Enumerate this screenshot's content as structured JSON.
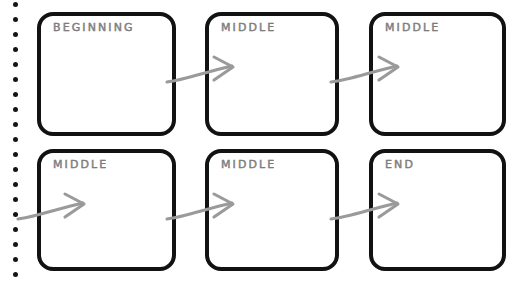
{
  "document": {
    "type": "storyboard-worksheet",
    "medium": "spiral-bound notebook page",
    "title_text_style": "hand-lettered outline capitals",
    "background_color": "#ffffff",
    "frame_border_color": "#121212",
    "label_color": "#8f8f8f",
    "arrow_color": "#9a9a9a",
    "binding_dot_color": "#151515"
  },
  "binding": {
    "name": "spiral-binding",
    "dot_count": 19,
    "dot_diameter_px": 5,
    "first_dot_y": 2,
    "dot_spacing_px": 15,
    "dot_center_x": 15
  },
  "frames": [
    {
      "id": "frame-1",
      "label": "BEGINNING",
      "row": 1,
      "column": 1,
      "x": 37,
      "y": 12,
      "width": 139,
      "height": 124,
      "content": ""
    },
    {
      "id": "frame-2",
      "label": "MIDDLE",
      "row": 1,
      "column": 2,
      "x": 205,
      "y": 12,
      "width": 134,
      "height": 124,
      "content": ""
    },
    {
      "id": "frame-3",
      "label": "MIDDLE",
      "row": 1,
      "column": 3,
      "x": 369,
      "y": 12,
      "width": 137,
      "height": 124,
      "content": ""
    },
    {
      "id": "frame-4",
      "label": "MIDDLE",
      "row": 2,
      "column": 1,
      "x": 37,
      "y": 149,
      "width": 139,
      "height": 122,
      "content": ""
    },
    {
      "id": "frame-5",
      "label": "MIDDLE",
      "row": 2,
      "column": 2,
      "x": 205,
      "y": 149,
      "width": 134,
      "height": 122,
      "content": ""
    },
    {
      "id": "frame-6",
      "label": "END",
      "row": 2,
      "column": 3,
      "x": 369,
      "y": 149,
      "width": 137,
      "height": 122,
      "content": ""
    }
  ],
  "arrows": [
    {
      "id": "arrow-1",
      "name": "arrow-frame1-to-frame2",
      "from": "frame-1",
      "to": "frame-2",
      "path": "M 167 82 C 185 80 205 72 232 66",
      "head": "M 214 57 L 233 67 L 214 80"
    },
    {
      "id": "arrow-2",
      "name": "arrow-frame2-to-frame3",
      "from": "frame-2",
      "to": "frame-3",
      "path": "M 331 82 C 350 80 370 72 397 66",
      "head": "M 379 57 L 398 67 L 379 80"
    },
    {
      "id": "arrow-3",
      "name": "arrow-margin-to-frame4",
      "from": "page-margin",
      "to": "frame-4",
      "path": "M 18 219 C 36 217 56 209 83 203",
      "head": "M 65 194 L 84 204 L 65 217"
    },
    {
      "id": "arrow-4",
      "name": "arrow-frame4-to-frame5",
      "from": "frame-4",
      "to": "frame-5",
      "path": "M 167 219 C 185 217 205 209 232 203",
      "head": "M 214 194 L 233 204 L 214 217"
    },
    {
      "id": "arrow-5",
      "name": "arrow-frame5-to-frame6",
      "from": "frame-5",
      "to": "frame-6",
      "path": "M 331 219 C 350 217 370 209 397 203",
      "head": "M 379 194 L 398 204 L 379 217"
    }
  ]
}
